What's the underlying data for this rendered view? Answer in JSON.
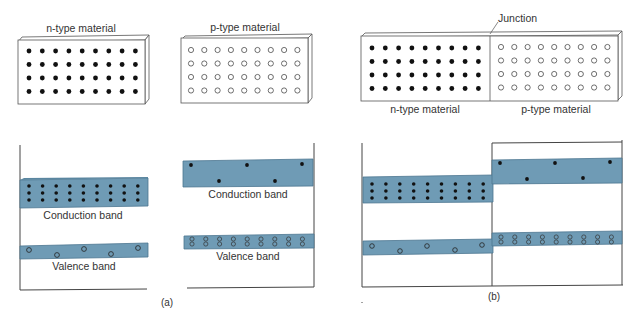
{
  "panel_a": {
    "n_label": "n-type material",
    "p_label": "p-type material",
    "n_conduction_label": "Conduction band",
    "n_valence_label": "Valence band",
    "p_conduction_label": "Conduction band",
    "p_valence_label": "Valence band",
    "caption": "(a)"
  },
  "panel_b": {
    "junction_label": "Junction",
    "n_label": "n-type material",
    "p_label": "p-type material",
    "caption": "(b)"
  },
  "colors": {
    "band_fill": "#6f9bb5",
    "band_edge": "#4d7690",
    "dot": "#111111",
    "line": "#444444"
  },
  "grid": {
    "rows": 4,
    "cols": 9
  }
}
